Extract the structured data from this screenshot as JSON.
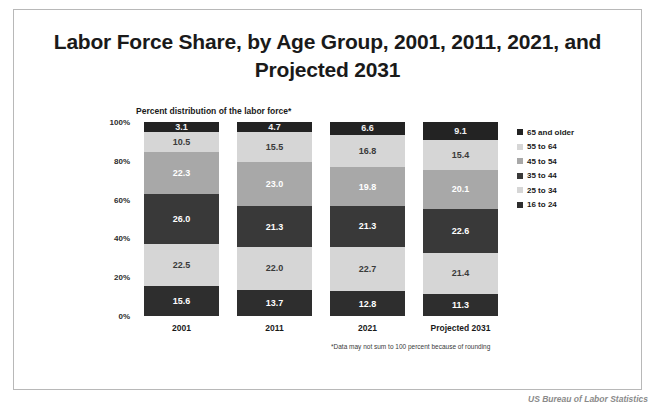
{
  "slide": {
    "title": "Labor Force Share, by Age Group, 2001, 2011, 2021, and Projected 2031",
    "footnote": "*Data may not sum to 100 percent because of rounding",
    "attribution": "US Bureau of Labor Statistics"
  },
  "chart_data": {
    "type": "bar",
    "subtype": "stacked-column-100",
    "title": "Labor Force Share, by Age Group, 2001, 2011, 2021, and Projected 2031",
    "subtitle": "Percent distribution of the labor force*",
    "xlabel": "",
    "ylabel": "",
    "ylim": [
      0,
      100
    ],
    "yticks": [
      0,
      20,
      40,
      60,
      80,
      100
    ],
    "ytick_labels": [
      "0%",
      "20%",
      "40%",
      "60%",
      "80%",
      "100%"
    ],
    "grid": false,
    "legend_position": "right",
    "categories": [
      "2001",
      "2011",
      "2021",
      "Projected 2031"
    ],
    "series": [
      {
        "name": "16 to 24",
        "color": "#2e2e2e",
        "text_color": "#ffffff",
        "values": [
          15.6,
          13.7,
          12.8,
          11.3
        ]
      },
      {
        "name": "25 to 34",
        "color": "#d6d6d6",
        "text_color": "#3a3a3a",
        "values": [
          22.5,
          22.0,
          22.7,
          21.4
        ]
      },
      {
        "name": "35 to 44",
        "color": "#393939",
        "text_color": "#ffffff",
        "values": [
          26.0,
          21.3,
          21.3,
          22.6
        ]
      },
      {
        "name": "45 to 54",
        "color": "#a8a8a8",
        "text_color": "#ffffff",
        "values": [
          22.3,
          23.0,
          19.8,
          20.1
        ]
      },
      {
        "name": "55 to 64",
        "color": "#d6d6d6",
        "text_color": "#3a3a3a",
        "values": [
          10.5,
          15.5,
          16.8,
          15.4
        ]
      },
      {
        "name": "65 and older",
        "color": "#232323",
        "text_color": "#f0f0f0",
        "values": [
          3.1,
          4.7,
          6.6,
          9.1
        ]
      }
    ],
    "legend_entries": [
      {
        "label": "65 and older",
        "color": "#232323"
      },
      {
        "label": "55 to 64",
        "color": "#d6d6d6"
      },
      {
        "label": "45 to 54",
        "color": "#a8a8a8"
      },
      {
        "label": "35 to 44",
        "color": "#393939"
      },
      {
        "label": "25 to 34",
        "color": "#d6d6d6"
      },
      {
        "label": "16 to 24",
        "color": "#2e2e2e"
      }
    ],
    "value_labels": {
      "2001": {
        "65 and older": "3.1",
        "55 to 64": "10.5",
        "45 to 54": "22.3",
        "35 to 44": "26.0",
        "25 to 34": "22.5",
        "16 to 24": "15.6"
      },
      "2011": {
        "65 and older": "4.7",
        "55 to 64": "15.5",
        "45 to 54": "23.0",
        "35 to 44": "21.3",
        "25 to 34": "22.0",
        "16 to 24": "13.7"
      },
      "2021": {
        "65 and older": "6.6",
        "55 to 64": "16.8",
        "45 to 54": "19.8",
        "35 to 44": "21.3",
        "25 to 34": "22.7",
        "16 to 24": "12.8"
      },
      "Projected 2031": {
        "65 and older": "9.1",
        "55 to 64": "15.4",
        "45 to 54": "20.1",
        "35 to 44": "22.6",
        "25 to 34": "21.4",
        "16 to 24": "11.3"
      }
    }
  }
}
